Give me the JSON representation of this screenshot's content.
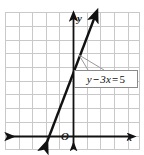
{
  "figure": {
    "type": "coordinate-grid-graph",
    "width": 144,
    "height": 155,
    "background": "#ffffff"
  },
  "grid": {
    "color": "#c9c9c9",
    "visible": true,
    "left": 5,
    "top": 12,
    "right": 140,
    "bottom": 150,
    "x_lines": [
      5,
      19,
      32,
      46,
      59,
      73,
      87,
      100,
      114,
      128,
      140
    ],
    "y_lines": [
      12,
      26,
      40,
      53,
      67,
      81,
      94,
      108,
      122,
      136,
      150
    ]
  },
  "axes": {
    "color": "#111111",
    "x_axis": {
      "label": "x",
      "y_pixel": 136,
      "x_start": 6,
      "x_end": 136,
      "arrow_left": true,
      "arrow_right": true
    },
    "y_axis": {
      "label": "y",
      "x_pixel": 73,
      "y_start": 150,
      "y_end": 14,
      "arrow_up": true,
      "arrow_down": true
    },
    "origin_label": "O"
  },
  "line": {
    "color": "#111111",
    "arrow_both_ends": true,
    "start_px": {
      "x": 44,
      "y": 150
    },
    "end_px": {
      "x": 97,
      "y": 11
    },
    "x_intercept_px": 46,
    "y_intercept_px": 55
  },
  "callout": {
    "equation": "y − 3x = 5",
    "equation_parts": {
      "variable_y": "y",
      "minus": "−",
      "term": "3x",
      "equals": "=",
      "value": "5"
    },
    "border_color": "#8a8a8a",
    "background": "#ffffff",
    "leader_from_px": {
      "x": 79,
      "y": 55
    },
    "leader_to_px": {
      "x": 104,
      "y": 70
    }
  },
  "colors": {
    "grid": "#c9c9c9",
    "axis": "#111111",
    "line": "#111111",
    "label_box_border": "#8a8a8a",
    "text": "#111111"
  }
}
